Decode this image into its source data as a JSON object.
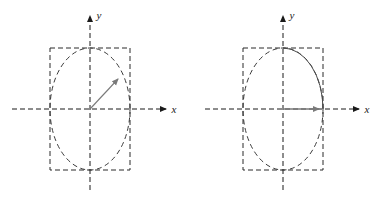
{
  "figure": {
    "width": 387,
    "height": 198,
    "background": "#ffffff",
    "colors": {
      "axis": "#1a1a1a",
      "ellipse_dashed": "#3a3a3a",
      "ellipse_solid": "#4a4a4a",
      "rectangle": "#2b2b2b",
      "vector": "#7a7a7a"
    }
  },
  "panels": [
    {
      "id": "left-panel",
      "name": "left-diagram",
      "origin": {
        "x": 90,
        "y": 109
      },
      "axes": {
        "x": {
          "label": "x",
          "style": "dashed",
          "arrow": "right",
          "start_x": 12,
          "end_x": 168,
          "y": 109
        },
        "y": {
          "label": "y",
          "style": "dashed",
          "arrow": "up",
          "start_y": 190,
          "end_y": 14,
          "x": 90
        }
      },
      "rectangle": {
        "name": "bounding-box",
        "style": "dashed",
        "x": 50,
        "y": 48,
        "width": 80,
        "height": 122
      },
      "ellipse": {
        "name": "polarization-ellipse",
        "style": "dashed",
        "cx": 90,
        "cy": 109,
        "rx": 40,
        "ry": 61,
        "solid_arc": false
      },
      "vector": {
        "name": "field-vector",
        "style": "solid",
        "from_x": 90,
        "from_y": 109,
        "to_x": 121,
        "to_y": 76,
        "angle_deg": 47,
        "arrow": true
      }
    },
    {
      "id": "right-panel",
      "name": "right-diagram",
      "origin": {
        "x": 283,
        "y": 109
      },
      "axes": {
        "x": {
          "label": "x",
          "style": "dashed",
          "arrow": "right",
          "start_x": 205,
          "end_x": 361,
          "y": 109
        },
        "y": {
          "label": "y",
          "style": "dashed",
          "arrow": "up",
          "start_y": 190,
          "end_y": 14,
          "x": 283
        }
      },
      "rectangle": {
        "name": "bounding-box",
        "style": "dashed",
        "x": 243,
        "y": 48,
        "width": 80,
        "height": 122
      },
      "ellipse": {
        "name": "polarization-ellipse",
        "style": "dashed",
        "cx": 283,
        "cy": 109,
        "rx": 40,
        "ry": 61,
        "solid_arc": true
      },
      "vector": {
        "name": "field-vector",
        "style": "solid",
        "from_x": 283,
        "from_y": 109,
        "to_x": 322,
        "to_y": 109,
        "angle_deg": 0,
        "arrow": true
      }
    }
  ],
  "labels": {
    "x_axis": "x",
    "y_axis": "y"
  }
}
